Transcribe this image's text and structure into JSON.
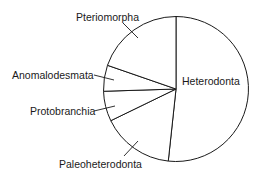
{
  "chart_data": {
    "type": "pie",
    "title": "",
    "start_angle_deg": 0,
    "direction": "clockwise",
    "categories": [
      "Heterodonta",
      "Paleoheterodonta",
      "Protobranchia",
      "Anomalodesmata",
      "Pteriomorpha"
    ],
    "values": [
      51.7,
      16.1,
      6.7,
      5.8,
      19.7
    ],
    "unit": "percent (estimated from slice angles)",
    "legend": "none (direct labels with leader lines)",
    "colors": {
      "fill": "#ffffff",
      "stroke": "#1a1a1a",
      "text": "#1a1a1a"
    }
  },
  "labels": {
    "heterodonta": "Heterodonta",
    "paleoheterodonta": "Paleoheterodonta",
    "protobranchia": "Protobranchia",
    "anomalodesmata": "Anomalodesmata",
    "pteriomorpha": "Pteriomorpha"
  }
}
